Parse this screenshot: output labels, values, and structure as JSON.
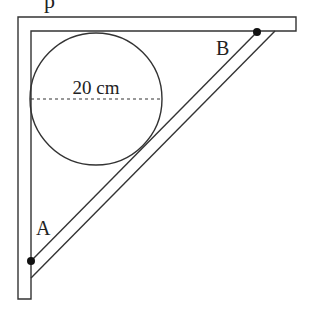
{
  "diagram": {
    "type": "geometry-figure",
    "labels": {
      "diameter": "20 cm",
      "point_a": "A",
      "point_b": "B",
      "partial_top_text": "p"
    },
    "colors": {
      "stroke": "#333333",
      "dot": "#111111",
      "background": "#ffffff"
    }
  }
}
